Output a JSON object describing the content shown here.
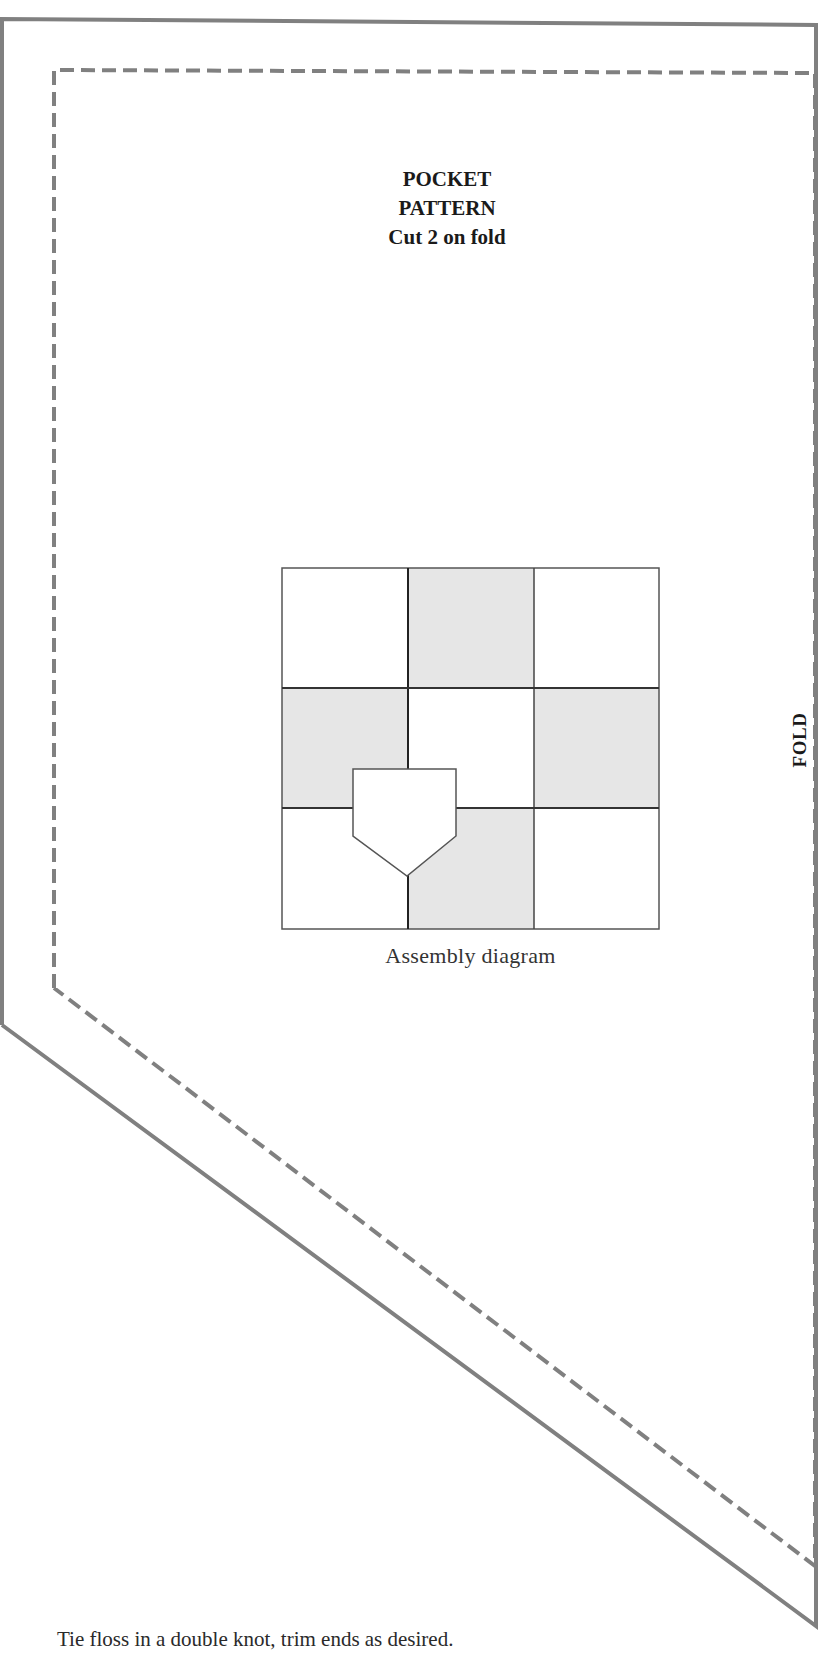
{
  "pattern": {
    "title_lines": [
      "POCKET",
      "PATTERN",
      "Cut 2 on fold"
    ],
    "fold_label": "FOLD",
    "outline_color": "#7f7f7f",
    "seam_line_style": "dashed"
  },
  "assembly_diagram": {
    "caption": "Assembly diagram",
    "grid": {
      "rows": 3,
      "cols": 3,
      "shading": [
        [
          "white",
          "gray",
          "white"
        ],
        [
          "gray",
          "white",
          "gray"
        ],
        [
          "white",
          "gray",
          "white"
        ]
      ],
      "gray_color": "#e6e6e6"
    },
    "pocket_shape": "pentagon (house/pocket outline) overlapping lower-left cells"
  },
  "footer": {
    "instruction": "Tie floss in a double knot, trim ends as desired."
  }
}
